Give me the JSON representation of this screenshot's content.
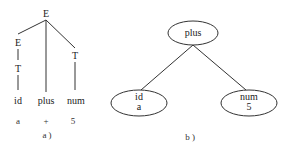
{
  "diagram_a": {
    "caption": "a )",
    "nodes": {
      "root": "E",
      "left_e": "E",
      "left_t": "T",
      "right_t": "T",
      "leaf_id": "id",
      "leaf_plus": "plus",
      "leaf_num": "num"
    },
    "values": {
      "id_value": "a",
      "plus_value": "+",
      "num_value": "5"
    }
  },
  "diagram_b": {
    "caption": "b )",
    "root": {
      "label": "plus"
    },
    "left": {
      "label": "id",
      "value": "a"
    },
    "right": {
      "label": "num",
      "value": "5"
    }
  }
}
